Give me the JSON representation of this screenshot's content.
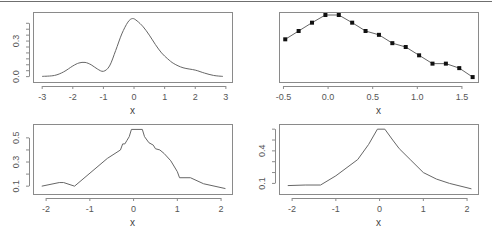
{
  "figure": {
    "colors": {
      "frame": "#8a8a8a",
      "line": "#666666",
      "point": "#111111",
      "text": "#555555"
    }
  },
  "chart_data": [
    {
      "id": "top-left",
      "type": "line",
      "title": "",
      "xlabel": "x",
      "ylabel": "",
      "xlim": [
        -3.3,
        3.2
      ],
      "ylim": [
        -0.02,
        0.52
      ],
      "xticks": [
        -3,
        -2,
        -1,
        0,
        1,
        2,
        3
      ],
      "xtick_labels": [
        "-3",
        "-2",
        "-1",
        "0",
        "1",
        "2",
        "3"
      ],
      "yticks": [
        0.0,
        0.05,
        0.1,
        0.15,
        0.2,
        0.25,
        0.3,
        0.35,
        0.4,
        0.45
      ],
      "ytick_labels": [
        {
          "value": 0.0,
          "label": "0.0"
        },
        {
          "value": 0.3,
          "label": "0.3"
        }
      ],
      "markers": false,
      "smooth": true,
      "x": [
        -3.0,
        -2.6,
        -2.3,
        -2.0,
        -1.8,
        -1.6,
        -1.4,
        -1.2,
        -1.0,
        -0.8,
        -0.6,
        -0.4,
        -0.2,
        -0.05,
        0.1,
        0.3,
        0.5,
        0.7,
        0.9,
        1.1,
        1.3,
        1.6,
        2.0,
        2.3,
        2.6,
        2.9
      ],
      "y": [
        0.002,
        0.01,
        0.04,
        0.09,
        0.115,
        0.12,
        0.1,
        0.065,
        0.045,
        0.09,
        0.22,
        0.36,
        0.46,
        0.49,
        0.47,
        0.42,
        0.35,
        0.27,
        0.2,
        0.15,
        0.11,
        0.075,
        0.055,
        0.03,
        0.01,
        0.002
      ]
    },
    {
      "id": "top-right",
      "type": "line",
      "title": "",
      "xlabel": "x",
      "ylabel": "",
      "xlim": [
        -0.55,
        1.68
      ],
      "ylim": [
        0.0,
        1.0
      ],
      "xticks": [
        -0.5,
        0.0,
        0.5,
        1.0,
        1.5
      ],
      "xtick_labels": [
        "-0.5",
        "0.0",
        "0.5",
        "1.0",
        "1.5"
      ],
      "yticks": [],
      "ytick_labels": [],
      "markers": true,
      "smooth": false,
      "x": [
        -0.48,
        -0.33,
        -0.18,
        -0.03,
        0.12,
        0.27,
        0.42,
        0.57,
        0.72,
        0.87,
        1.02,
        1.17,
        1.32,
        1.47,
        1.62
      ],
      "y": [
        0.62,
        0.75,
        0.88,
        1.0,
        1.0,
        0.88,
        0.75,
        0.69,
        0.56,
        0.5,
        0.37,
        0.24,
        0.24,
        0.17,
        0.03
      ]
    },
    {
      "id": "bottom-left",
      "type": "line",
      "title": "",
      "xlabel": "x",
      "ylabel": "",
      "xlim": [
        -2.3,
        2.25
      ],
      "ylim": [
        0.06,
        0.59
      ],
      "xticks": [
        -2,
        -1,
        0,
        1,
        2
      ],
      "xtick_labels": [
        "-2",
        "-1",
        "0",
        "1",
        "2"
      ],
      "yticks": [
        0.1,
        0.2,
        0.3,
        0.4,
        0.5
      ],
      "ytick_labels": [
        {
          "value": 0.1,
          "label": "0.1"
        },
        {
          "value": 0.3,
          "label": "0.3"
        },
        {
          "value": 0.5,
          "label": "0.5"
        }
      ],
      "markers": false,
      "smooth": false,
      "x": [
        -2.1,
        -1.7,
        -1.6,
        -1.35,
        -0.6,
        -0.3,
        -0.25,
        -0.2,
        -0.15,
        -0.1,
        -0.05,
        0.2,
        0.25,
        0.35,
        0.45,
        0.5,
        0.6,
        0.7,
        0.85,
        1.0,
        1.05,
        1.3,
        1.6,
        2.1
      ],
      "y": [
        0.1,
        0.13,
        0.13,
        0.1,
        0.33,
        0.4,
        0.45,
        0.45,
        0.48,
        0.51,
        0.57,
        0.57,
        0.51,
        0.46,
        0.44,
        0.41,
        0.4,
        0.37,
        0.31,
        0.22,
        0.17,
        0.17,
        0.12,
        0.08
      ]
    },
    {
      "id": "bottom-right",
      "type": "line",
      "title": "",
      "xlabel": "x",
      "ylabel": "",
      "xlim": [
        -2.3,
        2.25
      ],
      "ylim": [
        0.03,
        0.62
      ],
      "xticks": [
        -2,
        -1,
        0,
        1,
        2
      ],
      "xtick_labels": [
        "-2",
        "-1",
        "0",
        "1",
        "2"
      ],
      "yticks": [
        0.1,
        0.2,
        0.3,
        0.4,
        0.5,
        0.6
      ],
      "ytick_labels": [
        {
          "value": 0.1,
          "label": "0.1"
        },
        {
          "value": 0.4,
          "label": "0.4"
        }
      ],
      "markers": false,
      "smooth": false,
      "x": [
        -2.1,
        -1.7,
        -1.35,
        -1.0,
        -0.5,
        -0.25,
        -0.05,
        0.12,
        0.3,
        0.45,
        0.7,
        1.0,
        1.3,
        1.6,
        2.1
      ],
      "y": [
        0.08,
        0.085,
        0.085,
        0.17,
        0.32,
        0.46,
        0.6,
        0.6,
        0.5,
        0.42,
        0.32,
        0.2,
        0.14,
        0.1,
        0.05
      ]
    }
  ]
}
